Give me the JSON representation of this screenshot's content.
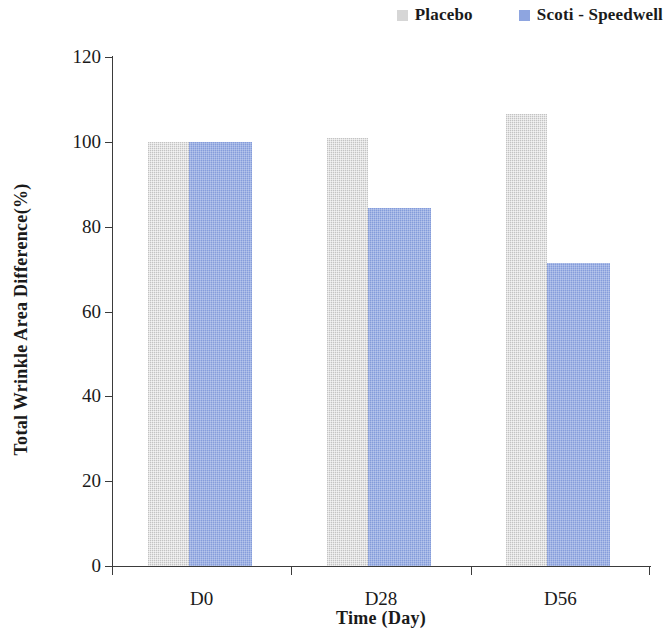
{
  "legend": {
    "position": "top-right",
    "entries": [
      {
        "label": "Placebo",
        "color": "#d6d6d6",
        "swatch_icon": "square-swatch-icon"
      },
      {
        "label": "Scoti - Speedwell",
        "color": "#8ea5e0",
        "swatch_icon": "square-swatch-icon"
      }
    ]
  },
  "axes": {
    "y_title": "Total Wrinkle Area Difference(%)",
    "x_title": "Time (Day)",
    "y_ticks": [
      "0",
      "20",
      "40",
      "60",
      "80",
      "100",
      "120"
    ],
    "x_ticks": [
      "D0",
      "D28",
      "D56"
    ]
  },
  "chart_data": {
    "type": "bar",
    "title": "",
    "subtitle": "",
    "categories": [
      "D0",
      "D28",
      "D56"
    ],
    "series": [
      {
        "name": "Placebo",
        "color": "#d6d6d6",
        "values": [
          100,
          101,
          106.5
        ]
      },
      {
        "name": "Scoti - Speedwell",
        "color": "#8ea5e0",
        "values": [
          100,
          84.3,
          71.5
        ]
      }
    ],
    "xlabel": "Time (Day)",
    "ylabel": "Total Wrinkle Area Difference(%)",
    "ylim": [
      0,
      120
    ],
    "ytick_step": 20,
    "grid": false,
    "legend_position": "top-right"
  }
}
